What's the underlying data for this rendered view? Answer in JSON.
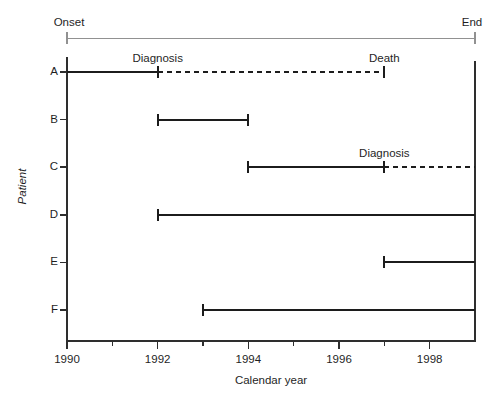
{
  "chart_data": {
    "type": "timeline",
    "title": "",
    "xlabel": "Calendar year",
    "ylabel": "Patient",
    "xlim": [
      1990,
      1999
    ],
    "x_ticks_major": [
      1990,
      1992,
      1994,
      1996,
      1998
    ],
    "x_ticks_minor": [
      1991,
      1993,
      1995,
      1997
    ],
    "grid": false,
    "top_band": {
      "left_label": "Onset",
      "right_label": "End"
    },
    "colors": {
      "line": "#1c1c1c",
      "axis": "#2e2e2e",
      "band": "#919191",
      "text": "#1f1f1f"
    },
    "line_styles": {
      "solid": "observed in study",
      "dashed": "after diagnosis / follow-up"
    },
    "patients": [
      {
        "id": "A",
        "segments": [
          {
            "from": 1990,
            "to": 1992,
            "style": "solid",
            "tick_start": false,
            "tick_end": true
          },
          {
            "from": 1992,
            "to": 1997,
            "style": "dashed",
            "tick_start": false,
            "tick_end": true
          }
        ],
        "annotations": [
          {
            "label": "Diagnosis",
            "year": 1992
          },
          {
            "label": "Death",
            "year": 1997
          }
        ]
      },
      {
        "id": "B",
        "segments": [
          {
            "from": 1992,
            "to": 1994,
            "style": "solid",
            "tick_start": true,
            "tick_end": true
          }
        ],
        "annotations": []
      },
      {
        "id": "C",
        "segments": [
          {
            "from": 1994,
            "to": 1997,
            "style": "solid",
            "tick_start": true,
            "tick_end": true
          },
          {
            "from": 1997,
            "to": 1999,
            "style": "dashed",
            "tick_start": false,
            "tick_end": false
          }
        ],
        "annotations": [
          {
            "label": "Diagnosis",
            "year": 1997
          }
        ]
      },
      {
        "id": "D",
        "segments": [
          {
            "from": 1992,
            "to": 1999,
            "style": "solid",
            "tick_start": true,
            "tick_end": false
          }
        ],
        "annotations": []
      },
      {
        "id": "E",
        "segments": [
          {
            "from": 1997,
            "to": 1999,
            "style": "solid",
            "tick_start": true,
            "tick_end": false
          }
        ],
        "annotations": []
      },
      {
        "id": "F",
        "segments": [
          {
            "from": 1993,
            "to": 1999,
            "style": "solid",
            "tick_start": true,
            "tick_end": false
          }
        ],
        "annotations": []
      }
    ]
  }
}
